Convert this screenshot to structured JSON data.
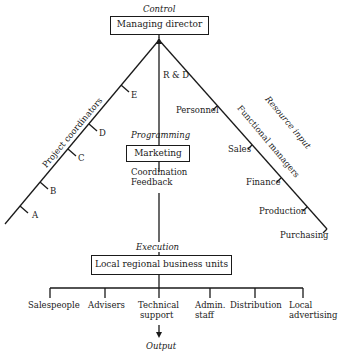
{
  "diagram": {
    "top_label": "Control",
    "top_box": "Managing director",
    "left_branch": {
      "label": "Project coordinators",
      "ticks": [
        "E",
        "D",
        "C",
        "B",
        "A"
      ]
    },
    "center_branch": {
      "label": "R & D",
      "stage_label": "Programming",
      "box": "Marketing",
      "notes": [
        "Coordination",
        "Feedback"
      ]
    },
    "right_branch": {
      "label": "Functional managers",
      "outer_label": "Resource input",
      "ticks": [
        "Personnel",
        "Sales",
        "Finance",
        "Production",
        "Purchasing"
      ]
    },
    "execution_label": "Execution",
    "bottom_box": "Local regional business units",
    "units": [
      {
        "line1": "Salespeople",
        "line2": ""
      },
      {
        "line1": "Advisers",
        "line2": ""
      },
      {
        "line1": "Technical",
        "line2": "support"
      },
      {
        "line1": "Admin.",
        "line2": "staff"
      },
      {
        "line1": "Distribution",
        "line2": ""
      },
      {
        "line1": "Local",
        "line2": "advertising"
      }
    ],
    "output_label": "Output"
  }
}
